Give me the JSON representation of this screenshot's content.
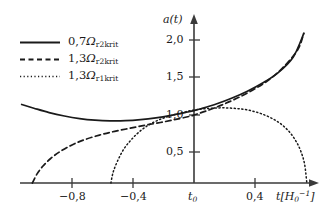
{
  "chart_data": {
    "type": "line",
    "title": "",
    "xlabel": "t[H_0^-1]",
    "ylabel": "a(t)",
    "xlim": [
      -1.2,
      0.85
    ],
    "ylim": [
      0,
      2.35
    ],
    "grid": false,
    "legend_position": "upper-left",
    "xticks": [
      {
        "value": -0.8,
        "label": "−0,8"
      },
      {
        "value": -0.4,
        "label": "−0,4"
      },
      {
        "value": 0.0,
        "label": "t0"
      },
      {
        "value": 0.4,
        "label": "0,4"
      }
    ],
    "yticks": [
      {
        "value": 0.5,
        "label": "0,5"
      },
      {
        "value": 1.0,
        "label": "1,0"
      },
      {
        "value": 1.5,
        "label": "1,5"
      },
      {
        "value": 2.0,
        "label": "2,0"
      }
    ],
    "series": [
      {
        "name": "0,7Ω_r2krit",
        "style": "solid",
        "color": "#1a1a1a",
        "x": [
          -1.13,
          -1.05,
          -0.95,
          -0.85,
          -0.75,
          -0.65,
          -0.55,
          -0.45,
          -0.35,
          -0.25,
          -0.15,
          -0.05,
          0.0,
          0.05,
          0.15,
          0.25,
          0.35,
          0.45,
          0.55,
          0.65,
          0.72
        ],
        "y": [
          1.155,
          1.1,
          1.035,
          0.985,
          0.948,
          0.925,
          0.915,
          0.917,
          0.932,
          0.958,
          0.995,
          1.04,
          1.065,
          1.095,
          1.165,
          1.25,
          1.35,
          1.47,
          1.62,
          1.85,
          2.2
        ]
      },
      {
        "name": "1,3Ω_r2krit",
        "style": "dashed",
        "color": "#1a1a1a",
        "x": [
          -1.06,
          -1.03,
          -0.99,
          -0.94,
          -0.88,
          -0.8,
          -0.72,
          -0.62,
          -0.52,
          -0.42,
          -0.32,
          -0.22,
          -0.12,
          -0.02,
          0.0,
          0.08,
          0.18,
          0.28,
          0.38,
          0.48,
          0.58,
          0.68,
          0.72
        ],
        "y": [
          0.0,
          0.13,
          0.25,
          0.36,
          0.46,
          0.56,
          0.635,
          0.705,
          0.76,
          0.805,
          0.85,
          0.89,
          0.935,
          0.985,
          1.0,
          1.06,
          1.145,
          1.245,
          1.36,
          1.5,
          1.69,
          1.96,
          2.2
        ]
      },
      {
        "name": "1,3Ω_r1krit",
        "style": "dotted",
        "color": "#1a1a1a",
        "x": [
          -0.545,
          -0.53,
          -0.5,
          -0.46,
          -0.41,
          -0.35,
          -0.28,
          -0.2,
          -0.12,
          -0.04,
          0.04,
          0.12,
          0.2,
          0.28,
          0.36,
          0.44,
          0.52,
          0.58,
          0.63,
          0.67,
          0.7,
          0.725,
          0.74
        ],
        "y": [
          0.0,
          0.16,
          0.33,
          0.5,
          0.64,
          0.77,
          0.875,
          0.955,
          1.01,
          1.055,
          1.085,
          1.1,
          1.105,
          1.095,
          1.07,
          1.02,
          0.94,
          0.85,
          0.74,
          0.61,
          0.47,
          0.28,
          0.0
        ]
      }
    ]
  },
  "legend": {
    "items": [
      {
        "num": "0,7",
        "omega": "Ω",
        "sub": "r2krit",
        "style": "solid"
      },
      {
        "num": "1,3",
        "omega": "Ω",
        "sub": "r2krit",
        "style": "dashed"
      },
      {
        "num": "1,3",
        "omega": "Ω",
        "sub": "r1krit",
        "style": "dotted"
      }
    ]
  },
  "axes": {
    "y_axis_label": "a(t)",
    "x_axis_label_t": "t",
    "x_axis_label_unit": "H",
    "x_axis_label_unit_sub": "0",
    "x_axis_label_unit_sup": "−1",
    "origin_label": "t",
    "origin_label_sub": "0"
  }
}
